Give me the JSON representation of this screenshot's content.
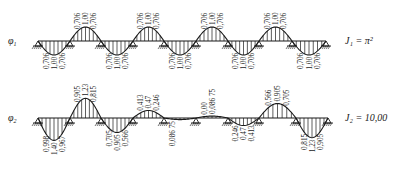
{
  "modes": [
    {
      "id": "mode-1",
      "symbol": "φ",
      "subscript": "1",
      "annotation": "J₁ = π²",
      "axis_y": 41,
      "amp_scale": 14,
      "supports_x": [
        38,
        70,
        101,
        133,
        164,
        196,
        228,
        259,
        292,
        326
      ],
      "spans": [
        {
          "sign": -1,
          "peak": 1.0,
          "labels": [
            "0,706",
            "1,00",
            "0,706"
          ]
        },
        {
          "sign": 1,
          "peak": 1.0,
          "labels": [
            "0,706",
            "1,00",
            "0,706"
          ]
        },
        {
          "sign": -1,
          "peak": 1.0,
          "labels": [
            "0,706",
            "1,00",
            "0,706"
          ]
        },
        {
          "sign": 1,
          "peak": 1.0,
          "labels": [
            "0,706",
            "1,00",
            "0,706"
          ]
        },
        {
          "sign": -1,
          "peak": 1.0,
          "labels": [
            "0,706",
            "1,00",
            "0,706"
          ]
        },
        {
          "sign": 1,
          "peak": 1.0,
          "labels": [
            "0,706",
            "1,00",
            "0,706"
          ]
        },
        {
          "sign": -1,
          "peak": 1.0,
          "labels": [
            "0,706",
            "1,00",
            "0,706"
          ]
        },
        {
          "sign": 1,
          "peak": 1.0,
          "labels": [
            "0,706",
            "1,00",
            "0,706"
          ]
        },
        {
          "sign": -1,
          "peak": 1.0,
          "labels": [
            "0,706",
            "1,00",
            "0,706"
          ]
        }
      ]
    },
    {
      "id": "mode-2",
      "symbol": "φ",
      "subscript": "2",
      "annotation": "J₂ = 10,00",
      "axis_y": 118,
      "amp_scale": 16,
      "supports_x": [
        38,
        70,
        101,
        133,
        164,
        196,
        228,
        259,
        296,
        328
      ],
      "spans": [
        {
          "sign": -1,
          "peak": 1.4,
          "labels": [
            "0,998",
            "1,40",
            "0,967"
          ]
        },
        {
          "sign": 1,
          "peak": 1.23,
          "labels": [
            "0,905",
            "1,23",
            "0,815"
          ]
        },
        {
          "sign": -1,
          "peak": 0.905,
          "labels": [
            "0,705",
            "0,905",
            "0,566"
          ]
        },
        {
          "sign": 1,
          "peak": 0.47,
          "labels": [
            "0,413",
            "0,47",
            "0,246"
          ]
        },
        {
          "sign": -1,
          "peak": 0.1,
          "labels": [
            "0,086 75",
            "",
            ""
          ]
        },
        {
          "sign": 1,
          "peak": 0.12,
          "labels": [
            "0,00",
            "0,086 75",
            ""
          ]
        },
        {
          "sign": -1,
          "peak": 0.47,
          "labels": [
            "0,246",
            "0,47",
            "0,413"
          ]
        },
        {
          "sign": 1,
          "peak": 0.905,
          "labels": [
            "0,566",
            "0,905",
            "0,705"
          ]
        },
        {
          "sign": -1,
          "peak": 1.23,
          "labels": [
            "0,815",
            "1,23",
            "0,905"
          ]
        },
        {
          "sign": 1,
          "peak": 1.4,
          "labels": [
            "0,937",
            "1,40",
            "0,998"
          ]
        }
      ]
    }
  ],
  "colors": {
    "ink": "#1a1a1a",
    "background": "#ffffff"
  }
}
